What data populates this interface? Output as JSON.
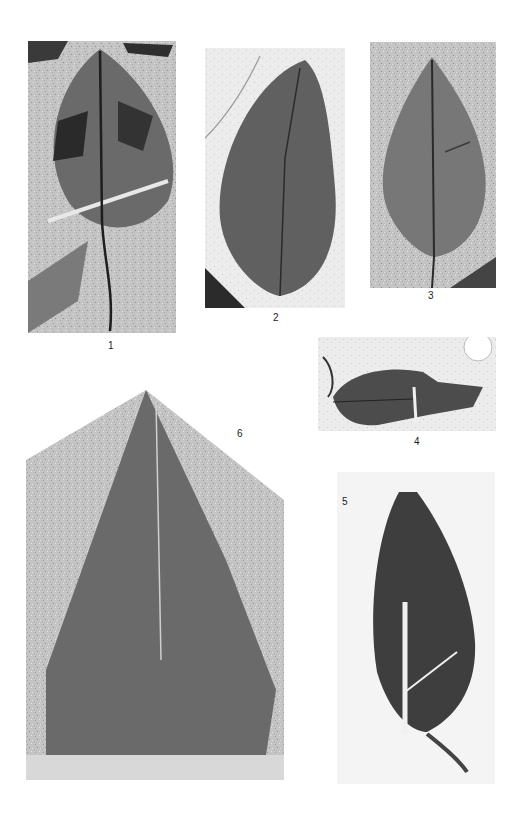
{
  "plate": {
    "figures": [
      {
        "id": "1",
        "label": "1"
      },
      {
        "id": "2",
        "label": "2"
      },
      {
        "id": "3",
        "label": "3"
      },
      {
        "id": "4",
        "label": "4"
      },
      {
        "id": "5",
        "label": "5"
      },
      {
        "id": "6",
        "label": "6"
      }
    ]
  },
  "colors": {
    "background": "#ffffff",
    "rock": "#bdbdbd",
    "leaf_dark": "#4a4a4a",
    "leaf_mid": "#6b6b6b"
  }
}
